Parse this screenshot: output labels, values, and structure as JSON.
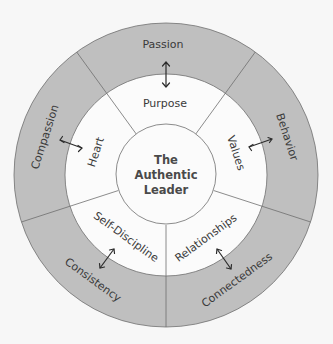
{
  "diagram": {
    "center": {
      "lines": [
        "The",
        "Authentic",
        "Leader"
      ]
    },
    "sections": [
      {
        "middle": "Purpose",
        "outer": "Passion"
      },
      {
        "middle": "Values",
        "outer": "Behavior"
      },
      {
        "middle": "Relationships",
        "outer": "Connectedness"
      },
      {
        "middle": "Self-Discipline",
        "outer": "Consistency"
      },
      {
        "middle": "Heart",
        "outer": "Compassion"
      }
    ],
    "colors": {
      "background": "#f7f7f7",
      "outer_ring": "#bfbfbf",
      "inner_fill": "#fbfbfb",
      "line": "#6e6e6e",
      "text": "#3a3a3a"
    }
  }
}
